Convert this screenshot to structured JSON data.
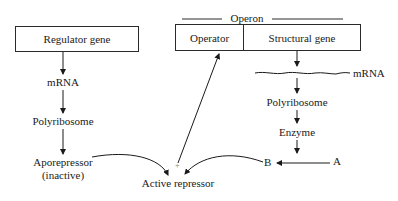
{
  "diagram": {
    "type": "gene regulation (operon repression model)",
    "regulator": {
      "box_label": "Regulator gene",
      "steps": [
        "mRNA",
        "Polyribosome",
        "Aporepressor",
        "(inactive)"
      ]
    },
    "operon": {
      "title": "Operon",
      "operator_label": "Operator",
      "structural_label": "Structural gene",
      "steps": [
        "mRNA",
        "Polyribosome",
        "Enzyme"
      ]
    },
    "reaction": {
      "substrate": "A",
      "product": "B",
      "plus_sign": "+",
      "result": "Active repressor"
    },
    "edges": [
      {
        "from": "Regulator gene",
        "to": "mRNA (regulator)"
      },
      {
        "from": "mRNA (regulator)",
        "to": "Polyribosome (regulator)"
      },
      {
        "from": "Polyribosome (regulator)",
        "to": "Aporepressor"
      },
      {
        "from": "Aporepressor",
        "to": "Active repressor"
      },
      {
        "from": "B",
        "to": "Active repressor"
      },
      {
        "from": "Active repressor",
        "to": "Operator"
      },
      {
        "from": "Structural gene",
        "to": "mRNA (operon)"
      },
      {
        "from": "mRNA (operon)",
        "to": "Polyribosome (operon)"
      },
      {
        "from": "Polyribosome (operon)",
        "to": "Enzyme"
      },
      {
        "from": "Enzyme",
        "to": "A→B reaction"
      },
      {
        "from": "A",
        "to": "B"
      }
    ]
  }
}
